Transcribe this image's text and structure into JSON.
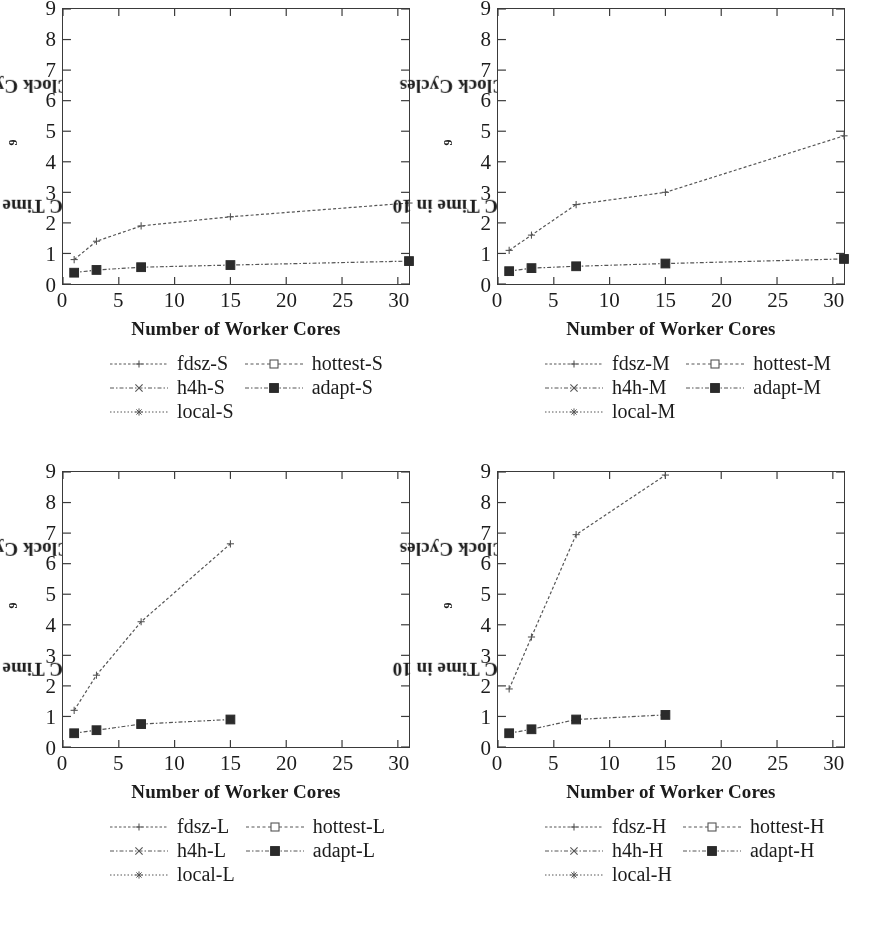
{
  "figure": {
    "panel_count": 4,
    "axis": {
      "xlabel": "Number of Worker Cores",
      "ylabel_prefix": "GC Time in 10",
      "ylabel_exponent": "9",
      "ylabel_suffix": " Clock Cycles",
      "xticks": [
        "0",
        "5",
        "10",
        "15",
        "20",
        "25",
        "30"
      ],
      "yticks": [
        "0",
        "1",
        "2",
        "3",
        "4",
        "5",
        "6",
        "7",
        "8",
        "9"
      ]
    },
    "colors": {
      "ink": "#1c1c1c",
      "axis": "#3a3a3a",
      "line": "#555555",
      "marker_filled": "#2b2b2b",
      "marker_open": "#ffffff"
    }
  },
  "panels": [
    {
      "id": "panel-small",
      "suffix": "S",
      "legend": [
        {
          "label": "fdsz-S",
          "key": "line-plus"
        },
        {
          "label": "hottest-S",
          "key": "line-open-square"
        },
        {
          "label": "h4h-S",
          "key": "line-cross"
        },
        {
          "label": "adapt-S",
          "key": "line-filled-square"
        },
        {
          "label": "local-S",
          "key": "line-star"
        }
      ]
    },
    {
      "id": "panel-medium",
      "suffix": "M",
      "legend": [
        {
          "label": "fdsz-M",
          "key": "line-plus"
        },
        {
          "label": "hottest-M",
          "key": "line-open-square"
        },
        {
          "label": "h4h-M",
          "key": "line-cross"
        },
        {
          "label": "adapt-M",
          "key": "line-filled-square"
        },
        {
          "label": "local-M",
          "key": "line-star"
        }
      ]
    },
    {
      "id": "panel-large",
      "suffix": "L",
      "legend": [
        {
          "label": "fdsz-L",
          "key": "line-plus"
        },
        {
          "label": "hottest-L",
          "key": "line-open-square"
        },
        {
          "label": "h4h-L",
          "key": "line-cross"
        },
        {
          "label": "adapt-L",
          "key": "line-filled-square"
        },
        {
          "label": "local-L",
          "key": "line-star"
        }
      ]
    },
    {
      "id": "panel-huge",
      "suffix": "H",
      "legend": [
        {
          "label": "fdsz-H",
          "key": "line-plus"
        },
        {
          "label": "hottest-H",
          "key": "line-open-square"
        },
        {
          "label": "h4h-H",
          "key": "line-cross"
        },
        {
          "label": "adapt-H",
          "key": "line-filled-square"
        },
        {
          "label": "local-H",
          "key": "line-star"
        }
      ]
    }
  ],
  "chart_data": [
    {
      "type": "line",
      "id": "panel-small",
      "title": "",
      "xlabel": "Number of Worker Cores",
      "ylabel": "GC Time in 10^9 Clock Cycles",
      "xlim": [
        0,
        31
      ],
      "ylim": [
        0,
        9
      ],
      "xticks": [
        0,
        5,
        10,
        15,
        20,
        25,
        30
      ],
      "yticks": [
        0,
        1,
        2,
        3,
        4,
        5,
        6,
        7,
        8,
        9
      ],
      "grid": false,
      "legend_position": "below",
      "x": [
        1,
        3,
        7,
        15,
        31
      ],
      "series": [
        {
          "name": "fdsz-S",
          "marker": "plus",
          "values": [
            0.8,
            1.4,
            1.9,
            2.2,
            2.65
          ]
        },
        {
          "name": "adapt-S",
          "marker": "filled-square",
          "values": [
            0.37,
            0.46,
            0.55,
            0.62,
            0.75
          ]
        },
        {
          "name": "hottest-S",
          "marker": "open-square",
          "values": [
            0.37,
            0.46,
            0.55,
            0.62,
            0.75
          ]
        },
        {
          "name": "h4h-S",
          "marker": "cross",
          "values": [
            0.8,
            1.4,
            1.9,
            2.2,
            2.65
          ]
        },
        {
          "name": "local-S",
          "marker": "star",
          "values": [
            0.8,
            1.4,
            1.9,
            2.2,
            2.65
          ]
        }
      ]
    },
    {
      "type": "line",
      "id": "panel-medium",
      "title": "",
      "xlabel": "Number of Worker Cores",
      "ylabel": "GC Time in 10^9 Clock Cycles",
      "xlim": [
        0,
        31
      ],
      "ylim": [
        0,
        9
      ],
      "xticks": [
        0,
        5,
        10,
        15,
        20,
        25,
        30
      ],
      "yticks": [
        0,
        1,
        2,
        3,
        4,
        5,
        6,
        7,
        8,
        9
      ],
      "grid": false,
      "legend_position": "below",
      "x": [
        1,
        3,
        7,
        15,
        31
      ],
      "series": [
        {
          "name": "fdsz-M",
          "marker": "plus",
          "values": [
            1.1,
            1.6,
            2.6,
            3.0,
            4.85
          ]
        },
        {
          "name": "adapt-M",
          "marker": "filled-square",
          "values": [
            0.42,
            0.52,
            0.58,
            0.67,
            0.82
          ]
        },
        {
          "name": "hottest-M",
          "marker": "open-square",
          "values": [
            0.42,
            0.52,
            0.58,
            0.67,
            0.82
          ]
        },
        {
          "name": "h4h-M",
          "marker": "cross",
          "values": [
            1.1,
            1.6,
            2.6,
            3.0,
            4.85
          ]
        },
        {
          "name": "local-M",
          "marker": "star",
          "values": [
            1.1,
            1.6,
            2.6,
            3.0,
            4.85
          ]
        }
      ]
    },
    {
      "type": "line",
      "id": "panel-large",
      "title": "",
      "xlabel": "Number of Worker Cores",
      "ylabel": "GC Time in 10^9 Clock Cycles",
      "xlim": [
        0,
        31
      ],
      "ylim": [
        0,
        9
      ],
      "xticks": [
        0,
        5,
        10,
        15,
        20,
        25,
        30
      ],
      "yticks": [
        0,
        1,
        2,
        3,
        4,
        5,
        6,
        7,
        8,
        9
      ],
      "grid": false,
      "legend_position": "below",
      "x": [
        1,
        3,
        7,
        15
      ],
      "series": [
        {
          "name": "fdsz-L",
          "marker": "plus",
          "values": [
            1.2,
            2.35,
            4.1,
            6.65
          ]
        },
        {
          "name": "adapt-L",
          "marker": "filled-square",
          "values": [
            0.45,
            0.55,
            0.75,
            0.9
          ]
        },
        {
          "name": "hottest-L",
          "marker": "open-square",
          "values": [
            0.45,
            0.55,
            0.75,
            0.9
          ]
        },
        {
          "name": "h4h-L",
          "marker": "cross",
          "values": [
            1.2,
            2.35,
            4.1,
            6.65
          ]
        },
        {
          "name": "local-L",
          "marker": "star",
          "values": [
            1.2,
            2.35,
            4.1,
            6.65
          ]
        }
      ]
    },
    {
      "type": "line",
      "id": "panel-huge",
      "title": "",
      "xlabel": "Number of Worker Cores",
      "ylabel": "GC Time in 10^9 Clock Cycles",
      "xlim": [
        0,
        31
      ],
      "ylim": [
        0,
        9
      ],
      "xticks": [
        0,
        5,
        10,
        15,
        20,
        25,
        30
      ],
      "yticks": [
        0,
        1,
        2,
        3,
        4,
        5,
        6,
        7,
        8,
        9
      ],
      "grid": false,
      "legend_position": "below",
      "x": [
        1,
        3,
        7,
        15
      ],
      "series": [
        {
          "name": "fdsz-H",
          "marker": "plus",
          "values": [
            1.9,
            3.6,
            6.95,
            8.9
          ]
        },
        {
          "name": "adapt-H",
          "marker": "filled-square",
          "values": [
            0.45,
            0.58,
            0.9,
            1.05
          ]
        },
        {
          "name": "hottest-H",
          "marker": "open-square",
          "values": [
            0.45,
            0.58,
            0.9,
            1.05
          ]
        },
        {
          "name": "h4h-H",
          "marker": "cross",
          "values": [
            1.9,
            3.6,
            6.95,
            8.9
          ]
        },
        {
          "name": "local-H",
          "marker": "star",
          "values": [
            1.9,
            3.6,
            6.95,
            8.9
          ]
        }
      ]
    }
  ]
}
